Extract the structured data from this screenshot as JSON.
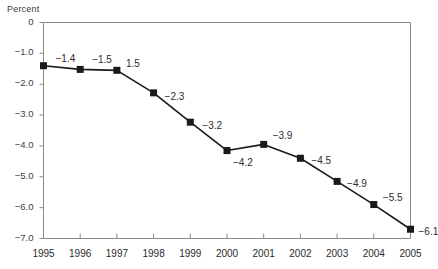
{
  "chart_data": {
    "type": "line",
    "title": "",
    "subtitle": "",
    "xlabel": "",
    "ylabel": "Percent",
    "x": [
      1995,
      1996,
      1997,
      1998,
      1999,
      2000,
      2001,
      2002,
      2003,
      2004,
      2005
    ],
    "categories": [
      "1995",
      "1996",
      "1997",
      "1998",
      "1999",
      "2000",
      "2001",
      "2002",
      "2003",
      "2004",
      "2005"
    ],
    "values": [
      -1.4,
      -1.5,
      -1.5,
      -2.3,
      -3.2,
      -4.2,
      -3.9,
      -4.5,
      -4.9,
      -5.5,
      -6.1
    ],
    "point_labels": [
      "−1.4",
      "−1.5",
      "1.5",
      "−2.3",
      "−3.2",
      "−4.2",
      "−3.9",
      "−4.5",
      "−4.9",
      "−5.5",
      "−6.1"
    ],
    "plotted_values": [
      -1.4,
      -1.52,
      -1.55,
      -2.28,
      -3.23,
      -4.15,
      -3.95,
      -4.4,
      -5.15,
      -5.9,
      -6.7
    ],
    "xtick_labels": [
      "1995",
      "1996",
      "1997",
      "1998",
      "1999",
      "2000",
      "2001",
      "2002",
      "2003",
      "2004",
      "2005"
    ],
    "ytick_labels": [
      "0",
      "−1.0",
      "−2.0",
      "−3.0",
      "−4.0",
      "−5.0",
      "−6.0",
      "−7.0"
    ],
    "ytick_values": [
      0,
      -1.0,
      -2.0,
      -3.0,
      -4.0,
      -5.0,
      -6.0,
      -7.0
    ],
    "ylim": [
      -7.0,
      0
    ],
    "xlim": [
      1995,
      2005
    ],
    "grid": false,
    "legend": null,
    "marker": "square",
    "line_color": "#1a1a1a",
    "marker_color": "#1a1a1a",
    "axis_color": "#8a8a8a",
    "frame": [
      "top",
      "right",
      "left",
      "bottom"
    ]
  },
  "label_offsets": [
    {
      "dx": 12,
      "dy": -13
    },
    {
      "dx": 12,
      "dy": -15
    },
    {
      "dx": 9,
      "dy": -12
    },
    {
      "dx": 11,
      "dy": -2
    },
    {
      "dx": 12,
      "dy": -2
    },
    {
      "dx": 6,
      "dy": 6
    },
    {
      "dx": 9,
      "dy": -14
    },
    {
      "dx": 11,
      "dy": -3
    },
    {
      "dx": 10,
      "dy": -3
    },
    {
      "dx": 9,
      "dy": -13
    },
    {
      "dx": 8,
      "dy": -3
    }
  ]
}
